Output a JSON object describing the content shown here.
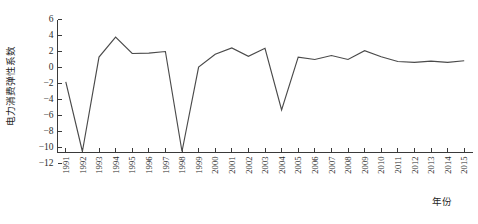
{
  "chart_data": {
    "type": "line",
    "title": "",
    "xlabel": "年份",
    "ylabel": "电力消费弹性系数",
    "categories": [
      "1991",
      "1992",
      "1993",
      "1994",
      "1995",
      "1996",
      "1997",
      "1998",
      "1999",
      "2000",
      "2001",
      "2002",
      "2003",
      "2004",
      "2005",
      "2006",
      "2007",
      "2008",
      "2009",
      "2010",
      "2011",
      "2012",
      "2013",
      "2014",
      "2015"
    ],
    "values": [
      -1.8,
      -10.5,
      1.3,
      3.8,
      1.75,
      1.8,
      2.0,
      -10.5,
      0.05,
      1.65,
      2.45,
      1.4,
      2.4,
      -5.3,
      1.3,
      1.0,
      1.5,
      1.0,
      2.1,
      1.35,
      0.75,
      0.65,
      0.8,
      0.65,
      0.85
    ],
    "series": [
      {
        "name": "电力消费弹性系数",
        "values": [
          -1.8,
          -10.5,
          1.3,
          3.8,
          1.75,
          1.8,
          2.0,
          -10.5,
          0.05,
          1.65,
          2.45,
          1.4,
          2.4,
          -5.3,
          1.3,
          1.0,
          1.5,
          1.0,
          2.1,
          1.35,
          0.75,
          0.65,
          0.8,
          0.65,
          0.85
        ]
      }
    ],
    "ylim": [
      -12,
      6
    ],
    "yticks": [
      6,
      4,
      2,
      0,
      -2,
      -4,
      -6,
      -8,
      -10,
      -12
    ],
    "ytick_labels": [
      "6",
      "4",
      "2",
      "0",
      "−2",
      "−4",
      "−6",
      "−8",
      "−10",
      "−12"
    ],
    "xticks": [
      "1991",
      "1992",
      "1993",
      "1994",
      "1995",
      "1996",
      "1997",
      "1998",
      "1999",
      "2000",
      "2001",
      "2002",
      "2003",
      "2004",
      "2005",
      "2006",
      "2007",
      "2008",
      "2009",
      "2010",
      "2011",
      "2012",
      "2013",
      "2014",
      "2015"
    ],
    "grid": false,
    "legend": false,
    "legend_position": "none",
    "line_color": "#4a4a4a",
    "axis_color": "#3a3a3a",
    "background_color": "#ffffff"
  },
  "figure": {
    "caption": "",
    "y_axis_title": "电力消费弹性系数",
    "x_axis_title": "年份"
  }
}
